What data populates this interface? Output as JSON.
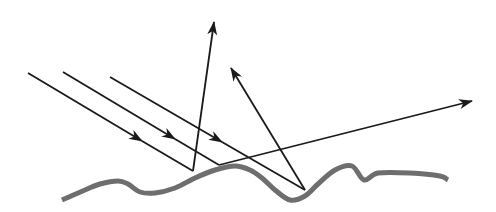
{
  "diagram": {
    "colors": {
      "background": "#ffffff",
      "rays": "#1a1a1a",
      "surface": "#6e6e6e"
    },
    "surface": {
      "points": [
        [
          62,
          200
        ],
        [
          85,
          190
        ],
        [
          100,
          184
        ],
        [
          118,
          181
        ],
        [
          128,
          184
        ],
        [
          140,
          192
        ],
        [
          155,
          193
        ],
        [
          175,
          188
        ],
        [
          195,
          178
        ],
        [
          215,
          170
        ],
        [
          235,
          166
        ],
        [
          250,
          170
        ],
        [
          262,
          178
        ],
        [
          275,
          190
        ],
        [
          290,
          200
        ],
        [
          305,
          196
        ],
        [
          318,
          184
        ],
        [
          335,
          170
        ],
        [
          352,
          166
        ],
        [
          364,
          180
        ],
        [
          378,
          173
        ],
        [
          410,
          173
        ],
        [
          440,
          176
        ],
        [
          448,
          180
        ]
      ]
    },
    "incident_rays": [
      {
        "id": "ray-1",
        "start": [
          28,
          73
        ],
        "hit": [
          193,
          171
        ],
        "arrow_at": [
          142,
          141
        ]
      },
      {
        "id": "ray-2",
        "start": [
          63,
          72
        ],
        "hit": [
          219,
          165
        ],
        "arrow_at": [
          175,
          139
        ]
      },
      {
        "id": "ray-3",
        "start": [
          110,
          77
        ],
        "hit": [
          305,
          190
        ],
        "arrow_at": [
          222,
          142
        ]
      }
    ],
    "reflected_rays": [
      {
        "id": "reflect-1",
        "start": [
          193,
          171
        ],
        "end": [
          214,
          22
        ]
      },
      {
        "id": "reflect-2",
        "start": [
          219,
          165
        ],
        "end": [
          472,
          101
        ]
      },
      {
        "id": "reflect-3",
        "start": [
          305,
          190
        ],
        "end": [
          231,
          68
        ]
      }
    ]
  }
}
